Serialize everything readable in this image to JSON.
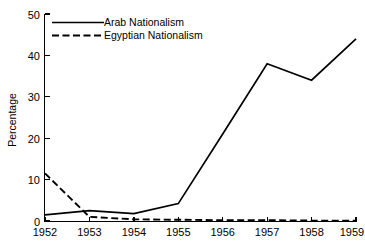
{
  "chart_data": {
    "type": "line",
    "title": "",
    "xlabel": "",
    "ylabel": "Percentage",
    "categories": [
      "1952",
      "1953",
      "1954",
      "1955",
      "1956",
      "1957",
      "1958",
      "1959"
    ],
    "x": [
      1952,
      1953,
      1954,
      1955,
      1956,
      1957,
      1958,
      1959
    ],
    "xlim": [
      1952,
      1959
    ],
    "ylim": [
      0,
      50
    ],
    "yticks": [
      0,
      10,
      20,
      30,
      40,
      50
    ],
    "ytick_labels": [
      "0",
      "10",
      "20",
      "30",
      "40",
      "50"
    ],
    "xticks": [
      1952,
      1953,
      1954,
      1955,
      1956,
      1957,
      1958,
      1959
    ],
    "xtick_labels": [
      "1952",
      "1953",
      "1954",
      "1955",
      "1956",
      "1957",
      "1958",
      "1959"
    ],
    "grid": false,
    "legend_position": "upper left",
    "legend_frame": false,
    "series": [
      {
        "name": "Arab Nationalism",
        "style": "solid",
        "color": "#000000",
        "values": [
          1.5,
          2.5,
          1.8,
          4.2,
          21.0,
          38.0,
          34.0,
          44.0
        ]
      },
      {
        "name": "Egyptian Nationalism",
        "style": "dashed",
        "color": "#000000",
        "values": [
          11.5,
          1.0,
          0.4,
          0.3,
          0.2,
          0.2,
          0.1,
          0.1
        ]
      }
    ],
    "annotations": []
  },
  "axes": {
    "ylabel": "Percentage",
    "ytick_0": "0",
    "ytick_1": "10",
    "ytick_2": "20",
    "ytick_3": "30",
    "ytick_4": "40",
    "ytick_5": "50",
    "xtick_0": "1952",
    "xtick_1": "1953",
    "xtick_2": "1954",
    "xtick_3": "1955",
    "xtick_4": "1956",
    "xtick_5": "1957",
    "xtick_6": "1958",
    "xtick_7": "1959"
  },
  "legend": {
    "entry_0": "Arab Nationalism",
    "entry_1": "Egyptian Nationalism"
  }
}
